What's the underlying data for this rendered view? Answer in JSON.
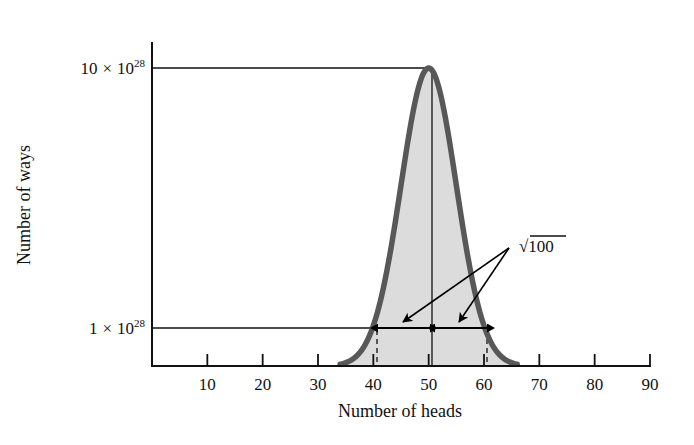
{
  "figure": {
    "background_color": "#ffffff",
    "curve_color": "#585858",
    "fill_color": "#dcdcdc",
    "line_color": "#000000"
  },
  "chart_data": {
    "type": "line",
    "title": "",
    "subtitle": "",
    "xlabel": "Number of heads",
    "ylabel": "Number of ways",
    "xlim": [
      0,
      90
    ],
    "ylim": [
      0,
      10
    ],
    "grid": false,
    "legend": "none",
    "x_ticks": [
      10,
      20,
      30,
      40,
      50,
      60,
      70,
      80,
      90
    ],
    "x_tick_labels": [
      "10",
      "20",
      "30",
      "40",
      "50",
      "60",
      "70",
      "80",
      "90"
    ],
    "y_ticks": [
      1,
      10
    ],
    "y_tick_labels": [
      "1 × 10²⁸",
      "10 × 10²⁸"
    ],
    "y_tick_parts": [
      {
        "mantissa": "1",
        "times": "×",
        "base": "10",
        "exponent": "28"
      },
      {
        "mantissa": "10",
        "times": "×",
        "base": "10",
        "exponent": "28"
      }
    ],
    "y_unit_exponent": "28",
    "distribution": {
      "shape": "gaussian",
      "mean": 50,
      "sigma": 5,
      "peak_value": 10,
      "peak_label": "10 × 10²⁸",
      "value_at_one_sigma": 6.07,
      "reference_level": 1,
      "visible_left_tail_x": 34,
      "visible_right_tail_x": 66
    },
    "series": [
      {
        "name": "Number of ways",
        "x": [
          34,
          36,
          38,
          40,
          42,
          44,
          46,
          48,
          50,
          52,
          54,
          56,
          58,
          60,
          62,
          64,
          66
        ],
        "values": [
          0.08,
          0.22,
          0.55,
          1.35,
          2.73,
          4.49,
          6.85,
          9.23,
          10.0,
          9.23,
          6.85,
          4.49,
          2.73,
          1.35,
          0.55,
          0.22,
          0.08
        ]
      }
    ],
    "shaded_region": {
      "description": "area under curve filled light gray",
      "fill_color": "#dcdcdc",
      "x_from": 34,
      "x_to": 66
    },
    "reference_lines": [
      {
        "name": "peak-reference-line",
        "orientation": "horizontal",
        "y": 10,
        "from_x": 0,
        "to_x": 50
      },
      {
        "name": "one-sigma-reference-line",
        "orientation": "horizontal",
        "y": 1,
        "from_x": 0,
        "to_x": 60
      },
      {
        "name": "mean-line",
        "orientation": "vertical",
        "x": 50,
        "from_y": 0,
        "to_y": 10
      }
    ],
    "dashed_lines": [
      {
        "name": "minus-one-sigma-dashed",
        "x": 40,
        "from_y": 0,
        "to_y": 1
      },
      {
        "name": "plus-one-sigma-dashed",
        "x": 60,
        "from_y": 0,
        "to_y": 1
      }
    ],
    "annotations": [
      {
        "name": "sqrt-100-label",
        "text": "√100",
        "radicand": "100",
        "radical": "√",
        "value": 10,
        "x": 62,
        "y": 2.9,
        "meaning": "standard deviation = sqrt(N) = sqrt(100) = 10"
      },
      {
        "name": "left-sigma-arrow",
        "type": "double-headed-arrow",
        "from_x": 40,
        "to_x": 50,
        "y": 1,
        "span": 10
      },
      {
        "name": "right-sigma-arrow",
        "type": "double-headed-arrow",
        "from_x": 50,
        "to_x": 60,
        "y": 1,
        "span": 10
      }
    ],
    "leader_lines": [
      {
        "name": "leader-to-left-arrow",
        "from_x": 61,
        "from_y": 2.7,
        "to_x": 43.5,
        "to_y": 1.05
      },
      {
        "name": "leader-to-right-arrow",
        "from_x": 61,
        "from_y": 2.7,
        "to_x": 53.5,
        "to_y": 1.05
      }
    ]
  }
}
